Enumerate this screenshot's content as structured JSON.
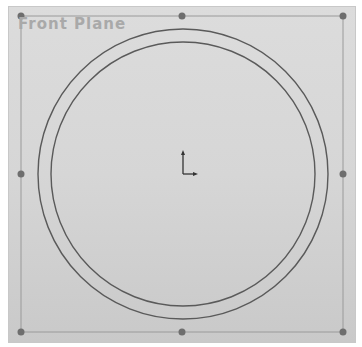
{
  "viewport": {
    "plane_name": "Front Plane",
    "background_color": "#d6d6d6"
  },
  "plane": {
    "border_color": "#8a8a8a",
    "rect": {
      "x": 21,
      "y": 16,
      "width": 322,
      "height": 316
    },
    "handles": [
      {
        "name": "top-left",
        "x": 21,
        "y": 16
      },
      {
        "name": "top-mid",
        "x": 182,
        "y": 16
      },
      {
        "name": "top-right",
        "x": 343,
        "y": 16
      },
      {
        "name": "mid-left",
        "x": 21,
        "y": 174
      },
      {
        "name": "mid-right",
        "x": 343,
        "y": 174
      },
      {
        "name": "bottom-left",
        "x": 21,
        "y": 332
      },
      {
        "name": "bottom-mid",
        "x": 182,
        "y": 332
      },
      {
        "name": "bottom-right",
        "x": 343,
        "y": 332
      }
    ]
  },
  "sketch": {
    "line_color": "#555555",
    "outer_circle": {
      "cx": 183,
      "cy": 174,
      "r": 145
    },
    "inner_circle": {
      "cx": 183,
      "cy": 174,
      "r": 132
    },
    "origin": {
      "x": 183,
      "y": 174,
      "icon": "sketch-origin-icon"
    }
  }
}
